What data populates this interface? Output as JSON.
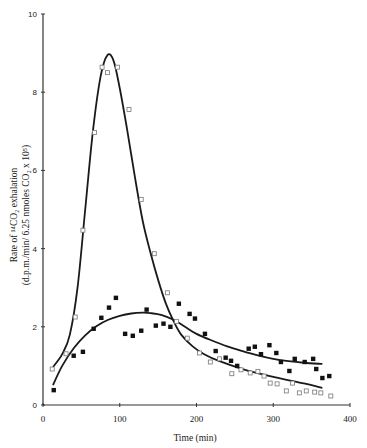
{
  "chart_data": {
    "type": "line",
    "title": "",
    "xlabel": "Time (min)",
    "ylabel_line1": "Rate of ¹⁴CO₂ exhalation",
    "ylabel_line2": "(d.p.m./min/ 6.25 nmoles CO₂ x 10⁵)",
    "xlim": [
      0,
      400
    ],
    "ylim": [
      0,
      10
    ],
    "xticks": [
      0,
      100,
      200,
      300,
      400
    ],
    "yticks": [
      0,
      2,
      4,
      6,
      8,
      10
    ],
    "grid": false,
    "legend": null,
    "series": [
      {
        "name": "open squares",
        "marker": "open-square",
        "points": [
          [
            12,
            0.92
          ],
          [
            30,
            1.31
          ],
          [
            42,
            2.25
          ],
          [
            52,
            4.47
          ],
          [
            67,
            6.97
          ],
          [
            77,
            8.64
          ],
          [
            84,
            8.5
          ],
          [
            97,
            8.64
          ],
          [
            112,
            7.56
          ],
          [
            128,
            5.26
          ],
          [
            145,
            3.87
          ],
          [
            162,
            2.87
          ],
          [
            174,
            2.14
          ],
          [
            188,
            1.71
          ],
          [
            204,
            1.33
          ],
          [
            218,
            1.1
          ],
          [
            230,
            1.18
          ],
          [
            246,
            0.8
          ],
          [
            258,
            0.9
          ],
          [
            270,
            0.82
          ],
          [
            280,
            0.86
          ],
          [
            288,
            0.74
          ],
          [
            296,
            0.56
          ],
          [
            305,
            0.54
          ],
          [
            317,
            0.36
          ],
          [
            325,
            0.56
          ],
          [
            334,
            0.31
          ],
          [
            343,
            0.36
          ],
          [
            354,
            0.33
          ],
          [
            362,
            0.31
          ],
          [
            375,
            0.23
          ]
        ],
        "fit_curve": [
          [
            13,
            0.97
          ],
          [
            25,
            1.3
          ],
          [
            35,
            1.8
          ],
          [
            45,
            3.0
          ],
          [
            55,
            5.0
          ],
          [
            65,
            7.0
          ],
          [
            75,
            8.4
          ],
          [
            84,
            8.95
          ],
          [
            92,
            8.8
          ],
          [
            100,
            8.1
          ],
          [
            110,
            7.0
          ],
          [
            120,
            5.8
          ],
          [
            130,
            4.7
          ],
          [
            140,
            3.9
          ],
          [
            150,
            3.2
          ],
          [
            160,
            2.6
          ],
          [
            170,
            2.15
          ],
          [
            180,
            1.8
          ],
          [
            195,
            1.5
          ],
          [
            210,
            1.3
          ],
          [
            230,
            1.12
          ],
          [
            260,
            0.92
          ],
          [
            300,
            0.72
          ],
          [
            340,
            0.55
          ],
          [
            364,
            0.44
          ]
        ]
      },
      {
        "name": "filled squares",
        "marker": "filled-square",
        "points": [
          [
            14,
            0.38
          ],
          [
            40,
            1.26
          ],
          [
            52,
            1.36
          ],
          [
            66,
            1.95
          ],
          [
            76,
            2.23
          ],
          [
            86,
            2.49
          ],
          [
            95,
            2.74
          ],
          [
            107,
            1.82
          ],
          [
            117,
            1.77
          ],
          [
            128,
            1.9
          ],
          [
            135,
            2.44
          ],
          [
            147,
            2.03
          ],
          [
            157,
            2.08
          ],
          [
            166,
            2.0
          ],
          [
            177,
            2.59
          ],
          [
            191,
            2.33
          ],
          [
            198,
            2.21
          ],
          [
            211,
            1.82
          ],
          [
            225,
            1.38
          ],
          [
            238,
            1.21
          ],
          [
            245,
            1.13
          ],
          [
            253,
            1.0
          ],
          [
            268,
            1.44
          ],
          [
            276,
            1.49
          ],
          [
            284,
            1.3
          ],
          [
            295,
            1.53
          ],
          [
            304,
            1.33
          ],
          [
            310,
            1.1
          ],
          [
            321,
            0.87
          ],
          [
            328,
            1.18
          ],
          [
            341,
            1.1
          ],
          [
            352,
            1.18
          ],
          [
            356,
            0.92
          ],
          [
            364,
            0.69
          ],
          [
            373,
            0.74
          ]
        ],
        "fit_curve": [
          [
            13,
            0.51
          ],
          [
            25,
            1.0
          ],
          [
            40,
            1.45
          ],
          [
            55,
            1.78
          ],
          [
            70,
            2.02
          ],
          [
            85,
            2.18
          ],
          [
            100,
            2.28
          ],
          [
            115,
            2.34
          ],
          [
            130,
            2.36
          ],
          [
            140,
            2.35
          ],
          [
            155,
            2.3
          ],
          [
            170,
            2.18
          ],
          [
            185,
            2.0
          ],
          [
            200,
            1.82
          ],
          [
            220,
            1.65
          ],
          [
            240,
            1.5
          ],
          [
            260,
            1.38
          ],
          [
            280,
            1.27
          ],
          [
            300,
            1.18
          ],
          [
            320,
            1.12
          ],
          [
            340,
            1.08
          ],
          [
            364,
            1.05
          ]
        ]
      }
    ]
  }
}
